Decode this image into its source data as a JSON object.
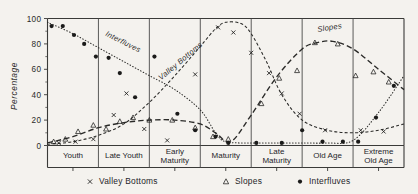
{
  "figure": {
    "y_axis_title": "Percentage",
    "y_ticks": [
      "0",
      "20",
      "40",
      "60",
      "80",
      "100"
    ],
    "categories": [
      "Youth",
      "Late Youth",
      "Early Maturity",
      "Maturity",
      "Late Maturity",
      "Old Age",
      "Extreme Old Age"
    ],
    "curve_labels": {
      "interfluves": "Interfluves",
      "valley_bottoms": "Valley Bottoms",
      "slopes": "Slopes"
    },
    "legend": [
      {
        "marker": "x-marker",
        "label": "Valley Bottoms"
      },
      {
        "marker": "triangle-marker",
        "label": "Slopes"
      },
      {
        "marker": "dot-marker",
        "label": "Interfluves"
      }
    ],
    "colors": {
      "ink": "#2a2a28",
      "paper": "#f4f2ee"
    }
  },
  "chart_data": {
    "type": "line",
    "title": "",
    "xlabel": "",
    "ylabel": "Percentage",
    "ylim": [
      0,
      100
    ],
    "grid": false,
    "legend_position": "bottom",
    "categories": [
      "Youth",
      "Late Youth",
      "Early Maturity",
      "Maturity",
      "Late Maturity",
      "Old Age",
      "Extreme Old Age"
    ],
    "x_stage_centers": [
      0.5,
      1.5,
      2.5,
      3.5,
      4.5,
      5.5,
      6.5
    ],
    "series": [
      {
        "name": "Interfluves",
        "marker": "dot-marker",
        "linestyle": "dotted",
        "curve_x": [
          0.0,
          0.5,
          1.0,
          1.5,
          2.0,
          2.5,
          3.0,
          3.3,
          3.5,
          4.0,
          4.5,
          5.0,
          5.5,
          6.0,
          6.5,
          7.0
        ],
        "curve_y": [
          97,
          88,
          77,
          66,
          55,
          44,
          28,
          10,
          3,
          2,
          2,
          2,
          2,
          4,
          26,
          55
        ],
        "points_x": [
          0.08,
          0.3,
          0.52,
          0.72,
          0.95,
          1.2,
          1.42,
          1.72,
          2.1,
          2.55,
          2.9,
          3.3,
          3.55,
          4.1,
          4.6,
          5.0,
          5.4,
          5.8,
          6.1,
          6.45,
          6.8
        ],
        "points_y": [
          94,
          94,
          87,
          80,
          70,
          69,
          57,
          38,
          70,
          25,
          12,
          7,
          2,
          2,
          2,
          12,
          3,
          3,
          3,
          22,
          47
        ]
      },
      {
        "name": "Valley Bottoms",
        "marker": "x-marker",
        "linestyle": "dashed",
        "curve_x": [
          0.0,
          0.5,
          1.0,
          1.5,
          2.0,
          2.5,
          3.0,
          3.3,
          3.5,
          3.8,
          4.0,
          4.3,
          4.6,
          5.0,
          5.5,
          6.0,
          6.5,
          7.0
        ],
        "curve_y": [
          1,
          3,
          8,
          17,
          34,
          55,
          78,
          92,
          97,
          96,
          88,
          66,
          40,
          20,
          12,
          10,
          12,
          17
        ],
        "points_x": [
          0.22,
          0.55,
          0.9,
          1.3,
          1.55,
          1.9,
          2.35,
          2.9,
          3.35,
          3.65,
          4.0,
          4.35,
          4.6,
          4.95,
          5.45,
          6.15,
          6.6
        ],
        "points_y": [
          2,
          3,
          5,
          24,
          41,
          13,
          4,
          56,
          93,
          89,
          73,
          57,
          41,
          25,
          12,
          12,
          11
        ]
      },
      {
        "name": "Slopes",
        "marker": "triangle-marker",
        "linestyle": "longdash",
        "curve_x": [
          0.0,
          0.5,
          1.0,
          1.5,
          2.0,
          2.5,
          3.0,
          3.3,
          3.6,
          4.0,
          4.5,
          5.0,
          5.3,
          5.6,
          6.0,
          6.5,
          7.0
        ],
        "curve_y": [
          2,
          7,
          14,
          18,
          20,
          20,
          17,
          10,
          3,
          24,
          54,
          76,
          81,
          82,
          76,
          60,
          44
        ],
        "points_x": [
          0.12,
          0.35,
          0.6,
          0.9,
          1.15,
          1.42,
          1.68,
          2.0,
          2.45,
          2.9,
          3.25,
          3.55,
          4.2,
          4.55,
          4.9,
          5.25,
          5.7,
          6.05,
          6.4,
          6.7
        ],
        "points_y": [
          3,
          5,
          11,
          16,
          13,
          19,
          22,
          20,
          20,
          14,
          7,
          5,
          33,
          53,
          59,
          81,
          80,
          55,
          58,
          50
        ]
      }
    ]
  }
}
